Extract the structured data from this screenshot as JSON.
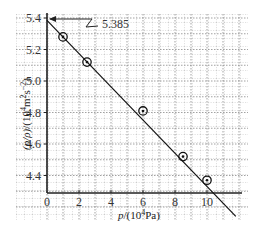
{
  "chart_data": {
    "type": "scatter",
    "title": "",
    "xlabel": "p/(10^4Pa)",
    "ylabel": "(p/ρ)/(10^4m^2s^-2)",
    "xlabel_parts": {
      "var": "p",
      "unit": "/(10",
      "exp": "4",
      "unit2": "Pa)"
    },
    "ylabel_parts": {
      "var": "(p/ρ)",
      "unit": "/(10",
      "exp": "4",
      "unit2": "m",
      "exp2": "2",
      "unit3": "s",
      "exp3": "−2",
      "close": ")"
    },
    "xlim": [
      0,
      12
    ],
    "ylim": [
      4.3,
      5.4
    ],
    "x_ticks": [
      "0",
      "2",
      "4",
      "6",
      "8",
      "10"
    ],
    "y_ticks": [
      "5.4",
      "5.2",
      "5.0",
      "4.8",
      "4.6",
      "4.4"
    ],
    "grid": true,
    "series": [
      {
        "name": "measured",
        "marker": "circled-dot",
        "x": [
          1.0,
          2.5,
          6.0,
          8.5,
          10.0
        ],
        "y": [
          5.28,
          5.12,
          4.81,
          4.52,
          4.37
        ]
      },
      {
        "name": "fit-line",
        "type": "line",
        "x": [
          0,
          11.8
        ],
        "y": [
          5.385,
          4.14
        ]
      }
    ],
    "annotations": [
      {
        "text": "5.385",
        "target": "y-intercept",
        "x": 0,
        "y": 5.385
      }
    ]
  }
}
